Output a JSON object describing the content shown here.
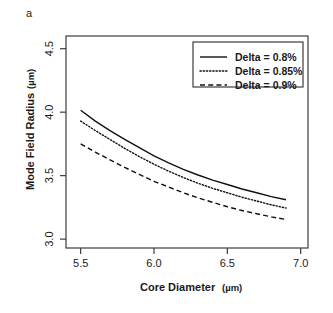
{
  "panel": {
    "label": "a"
  },
  "chart_data": {
    "type": "line",
    "title": "",
    "xlabel": "Core Diameter",
    "xunit": "(µm)",
    "ylabel": "Mode Field Radius",
    "yunit": "(µm)",
    "xlim": [
      5.4,
      7.05
    ],
    "ylim": [
      2.93,
      4.6
    ],
    "xticks": [
      5.5,
      6.0,
      6.5,
      7.0
    ],
    "xtick_labels": [
      "5.5",
      "6.0",
      "6.5",
      "7.0"
    ],
    "yticks": [
      3.0,
      3.5,
      4.0,
      4.5
    ],
    "ytick_labels": [
      "3.0",
      "3.5",
      "4.0",
      "4.5"
    ],
    "grid": false,
    "legend_position": "top-right",
    "x": [
      5.5,
      5.6,
      5.7,
      5.8,
      5.9,
      6.0,
      6.1,
      6.2,
      6.3,
      6.4,
      6.5,
      6.6,
      6.7,
      6.8,
      6.9
    ],
    "series": [
      {
        "name": "Delta = 0.8%",
        "dash": "solid",
        "values": [
          4.015,
          3.93,
          3.855,
          3.785,
          3.72,
          3.655,
          3.6,
          3.55,
          3.505,
          3.465,
          3.43,
          3.395,
          3.365,
          3.335,
          3.31
        ]
      },
      {
        "name": "Delta = 0.85%",
        "dash": "dotted",
        "values": [
          3.93,
          3.855,
          3.785,
          3.715,
          3.65,
          3.59,
          3.535,
          3.485,
          3.44,
          3.4,
          3.365,
          3.33,
          3.3,
          3.27,
          3.245
        ]
      },
      {
        "name": "Delta = 0.9%",
        "dash": "dashed",
        "values": [
          3.75,
          3.685,
          3.625,
          3.565,
          3.51,
          3.455,
          3.41,
          3.365,
          3.325,
          3.29,
          3.255,
          3.225,
          3.2,
          3.175,
          3.155
        ]
      }
    ]
  },
  "legend": {
    "entries": [
      {
        "label": "Delta = 0.8%",
        "dash": "solid"
      },
      {
        "label": "Delta = 0.85%",
        "dash": "dotted"
      },
      {
        "label": "Delta = 0.9%",
        "dash": "dashed"
      }
    ]
  }
}
